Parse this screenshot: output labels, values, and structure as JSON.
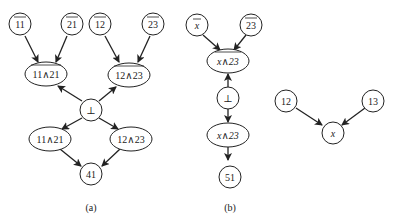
{
  "panel_a": {
    "caption": "(a)",
    "nodes": {
      "n11bar": {
        "label": "11",
        "overline": true
      },
      "n21bar": {
        "label": "21",
        "overline": true
      },
      "n12bar": {
        "label": "12",
        "overline": true
      },
      "n23bar": {
        "label": "23",
        "overline": true
      },
      "c11_21bar": {
        "label": "11∧21",
        "overline": true
      },
      "c12_23bar": {
        "label": "12∧23",
        "overline": true
      },
      "bottom": {
        "label": "⊥"
      },
      "c11_21": {
        "label": "11∧21"
      },
      "c12_23": {
        "label": "12∧23"
      },
      "n41": {
        "label": "41"
      }
    },
    "edges": [
      [
        "n11bar",
        "c11_21bar"
      ],
      [
        "n21bar",
        "c11_21bar"
      ],
      [
        "n12bar",
        "c12_23bar"
      ],
      [
        "n23bar",
        "c12_23bar"
      ],
      [
        "bottom",
        "c11_21bar"
      ],
      [
        "bottom",
        "c12_23bar"
      ],
      [
        "bottom",
        "c11_21"
      ],
      [
        "bottom",
        "c12_23"
      ],
      [
        "c11_21",
        "n41"
      ],
      [
        "c12_23",
        "n41"
      ]
    ]
  },
  "panel_b": {
    "caption": "(b)",
    "nodes": {
      "xbar": {
        "label": "x",
        "overline": true
      },
      "n23bar": {
        "label": "23",
        "overline": true
      },
      "cx_23bar": {
        "label": "x∧23",
        "overline": true
      },
      "bottom": {
        "label": "⊥"
      },
      "cx_23": {
        "label": "x∧23"
      },
      "n51": {
        "label": "51"
      },
      "n12": {
        "label": "12"
      },
      "n13": {
        "label": "13"
      },
      "x": {
        "label": "x"
      }
    },
    "edges": [
      [
        "xbar",
        "cx_23bar"
      ],
      [
        "n23bar",
        "cx_23bar"
      ],
      [
        "bottom",
        "cx_23bar"
      ],
      [
        "bottom",
        "cx_23"
      ],
      [
        "cx_23",
        "n51"
      ],
      [
        "n12",
        "x"
      ],
      [
        "n13",
        "x"
      ]
    ]
  }
}
